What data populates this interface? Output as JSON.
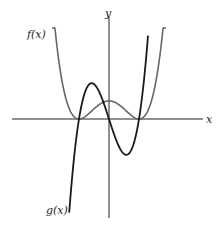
{
  "chart_data": {
    "type": "line",
    "title": "",
    "xlabel": "x",
    "ylabel": "y",
    "xlim": [
      -3.3,
      3.1
    ],
    "ylim": [
      -3.3,
      3.4
    ],
    "grid": false,
    "series": [
      {
        "name": "f(x)",
        "label": "f(x)",
        "formula": "0.6*(x^2-1)^2",
        "color": "#666666",
        "domain": [
          -1.9,
          1.9
        ],
        "notes": "double roots at x=-1 and x=1, local max at x=0"
      },
      {
        "name": "g(x)",
        "label": "g(x)",
        "formula": "3.1*x*(x^2-1)",
        "color": "#1a1a1a",
        "domain": [
          -1.35,
          1.3
        ],
        "notes": "roots at x=-1, 0, 1; local max near x=-0.58, local min near x=0.58"
      }
    ]
  }
}
